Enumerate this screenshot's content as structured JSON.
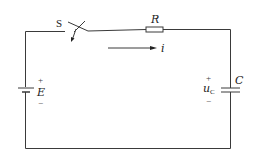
{
  "diagram": {
    "type": "RC series circuit",
    "switch": {
      "label": "S"
    },
    "resistor": {
      "label": "R"
    },
    "current": {
      "label": "i",
      "direction": "right"
    },
    "source": {
      "label": "E",
      "plus": "+",
      "minus": "−"
    },
    "capacitor": {
      "label": "C",
      "voltage_main": "u",
      "voltage_sub": "C",
      "plus": "+",
      "minus": "−"
    },
    "colors": {
      "wire": "#3a3a3a",
      "text": "#222222",
      "background": "#ffffff"
    }
  }
}
